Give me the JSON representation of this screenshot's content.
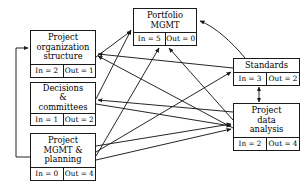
{
  "diagram": {
    "type": "dependency-network-diagram",
    "colors": {
      "stroke": "#1a1a1a",
      "node_fill": "#ffffff",
      "background": "#ffffff",
      "text": "#000000"
    },
    "labels": {
      "in_prefix": "In = ",
      "out_prefix": "Out = "
    },
    "nodes": [
      {
        "id": "project-organization-structure",
        "title": "Project\norganization\nstructure",
        "in_label": "In = 2",
        "out_label": "Out = 1",
        "in_value": 2,
        "out_value": 1,
        "x": 30,
        "y": 30,
        "w": 66,
        "h": 48
      },
      {
        "id": "decisions-committees",
        "title": "Decisions\n&\ncommittees",
        "in_label": "In = 1",
        "out_label": "Out = 2",
        "in_value": 1,
        "out_value": 2,
        "x": 30,
        "y": 82,
        "w": 66,
        "h": 44
      },
      {
        "id": "project-mgmt-planning",
        "title": "Project\nMGMT &\nplanning",
        "in_label": "In = 0",
        "out_label": "Out = 4",
        "in_value": 0,
        "out_value": 4,
        "x": 30,
        "y": 133,
        "w": 66,
        "h": 48
      },
      {
        "id": "portfolio-mgmt",
        "title": "Portfolio\nMGMT",
        "in_label": "In = 5",
        "out_label": "Out = 0",
        "in_value": 5,
        "out_value": 0,
        "x": 133,
        "y": 8,
        "w": 64,
        "h": 38
      },
      {
        "id": "standards",
        "title": "Standards",
        "in_label": "In = 3",
        "out_label": "Out = 2",
        "in_value": 3,
        "out_value": 2,
        "x": 233,
        "y": 58,
        "w": 67,
        "h": 28
      },
      {
        "id": "project-data-analysis",
        "title": "Project\ndata\nanalysis",
        "in_label": "In = 2",
        "out_label": "Out = 4",
        "in_value": 2,
        "out_value": 4,
        "x": 233,
        "y": 103,
        "w": 67,
        "h": 48
      }
    ],
    "edges": [
      {
        "id": "pos-to-portfolio",
        "from": "project-organization-structure",
        "to": "portfolio-mgmt",
        "arrow": "single"
      },
      {
        "id": "decisions-to-portfolio",
        "from": "decisions-committees",
        "to": "portfolio-mgmt",
        "arrow": "single"
      },
      {
        "id": "decisions-to-data",
        "from": "decisions-committees",
        "to": "project-data-analysis",
        "arrow": "single"
      },
      {
        "id": "planning-to-portfolio",
        "from": "project-mgmt-planning",
        "to": "portfolio-mgmt",
        "arrow": "single"
      },
      {
        "id": "planning-to-standards",
        "from": "project-mgmt-planning",
        "to": "standards",
        "arrow": "single"
      },
      {
        "id": "planning-to-data",
        "from": "project-mgmt-planning",
        "to": "project-data-analysis",
        "arrow": "single"
      },
      {
        "id": "planning-to-pos",
        "from": "project-mgmt-planning",
        "to": "project-organization-structure",
        "arrow": "single"
      },
      {
        "id": "standards-to-portfolio",
        "from": "standards",
        "to": "portfolio-mgmt",
        "arrow": "single"
      },
      {
        "id": "standards-to-pos",
        "from": "standards",
        "to": "project-organization-structure",
        "arrow": "single"
      },
      {
        "id": "data-to-portfolio",
        "from": "project-data-analysis",
        "to": "portfolio-mgmt",
        "arrow": "single"
      },
      {
        "id": "data-to-decisions",
        "from": "project-data-analysis",
        "to": "decisions-committees",
        "arrow": "single"
      },
      {
        "id": "data-to-pos",
        "from": "project-data-analysis",
        "to": "project-organization-structure",
        "arrow": "single"
      },
      {
        "id": "standards-data-bidirectional",
        "from": "standards",
        "to": "project-data-analysis",
        "arrow": "double"
      }
    ]
  }
}
